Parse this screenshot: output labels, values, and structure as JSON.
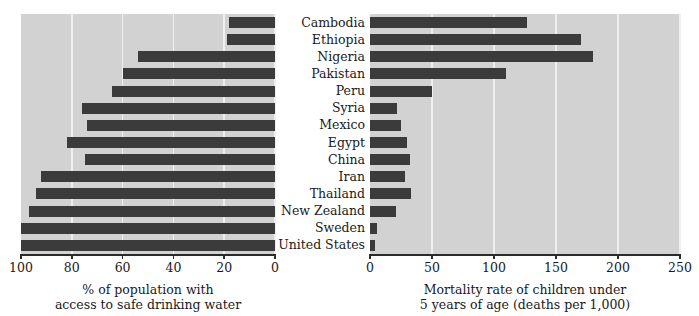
{
  "chart_data": {
    "type": "bar",
    "title": "",
    "orientation": "horizontal",
    "panels": [
      {
        "id": "water-access",
        "xlabel_line1": "% of population with",
        "xlabel_line2": "access to safe drinking water",
        "xlim": [
          100,
          0
        ],
        "direction": "reversed",
        "ticks": [
          100,
          80,
          60,
          40,
          20,
          0
        ],
        "tick_labels": [
          "100",
          "80",
          "60",
          "40",
          "20",
          "0"
        ],
        "grid": true,
        "values": [
          18,
          19,
          54,
          60,
          64,
          76,
          74,
          82,
          75,
          92,
          94,
          97,
          100,
          100
        ]
      },
      {
        "id": "child-mortality",
        "xlabel_line1": "Mortality rate of children under",
        "xlabel_line2": "5 years of age (deaths per 1,000)",
        "xlim": [
          0,
          250
        ],
        "direction": "normal",
        "ticks": [
          0,
          50,
          100,
          150,
          200,
          250
        ],
        "tick_labels": [
          "0",
          "50",
          "100",
          "150",
          "200",
          "250"
        ],
        "grid": true,
        "values": [
          127,
          170,
          180,
          110,
          50,
          22,
          25,
          30,
          32,
          28,
          33,
          21,
          6,
          4
        ]
      }
    ],
    "categories": [
      "Cambodia",
      "Ethiopia",
      "Nigeria",
      "Pakistan",
      "Peru",
      "Syria",
      "Mexico",
      "Egypt",
      "China",
      "Iran",
      "Thailand",
      "New Zealand",
      "Sweden",
      "United States"
    ],
    "series": [
      {
        "name": "% of population with access to safe drinking water",
        "panel": "water-access",
        "values": [
          18,
          19,
          54,
          60,
          64,
          76,
          74,
          82,
          75,
          92,
          94,
          97,
          100,
          100
        ]
      },
      {
        "name": "Mortality rate of children under 5 years of age (deaths per 1,000)",
        "panel": "child-mortality",
        "values": [
          127,
          170,
          180,
          110,
          50,
          22,
          25,
          30,
          32,
          28,
          33,
          21,
          6,
          4
        ]
      }
    ],
    "colors": {
      "bar": "#3b3b3b",
      "plot_background": "#d2d2d2",
      "gridline": "#efefef",
      "axis": "#2b2b2b",
      "text": "#1a1a1a",
      "page_background": "#ffffff"
    }
  }
}
